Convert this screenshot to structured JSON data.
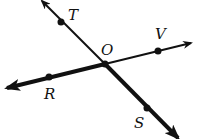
{
  "diagram": {
    "type": "intersecting-lines",
    "background": "#ffffff",
    "ink": "#111111",
    "intersection": {
      "label": "O",
      "x": 105,
      "y": 64,
      "label_x": 101,
      "label_y": 55
    },
    "lines": [
      {
        "name": "line-TS",
        "start": {
          "x": 42,
          "y": 1
        },
        "end": {
          "x": 178,
          "y": 138
        },
        "thin_width": 2,
        "bold_width": 4,
        "bold_segment": "O-to-S"
      },
      {
        "name": "line-RV",
        "start": {
          "x": 7,
          "y": 88
        },
        "end": {
          "x": 191,
          "y": 43
        },
        "thin_width": 2,
        "bold_width": 4,
        "bold_segment": "R-to-O"
      }
    ],
    "points": [
      {
        "label": "T",
        "x": 61,
        "y": 22,
        "label_x": 68,
        "label_y": 20
      },
      {
        "label": "V",
        "x": 158,
        "y": 51,
        "label_x": 155,
        "label_y": 39
      },
      {
        "label": "R",
        "x": 49,
        "y": 77,
        "label_x": 44,
        "label_y": 99
      },
      {
        "label": "S",
        "x": 147,
        "y": 108,
        "label_x": 134,
        "label_y": 128
      }
    ]
  }
}
